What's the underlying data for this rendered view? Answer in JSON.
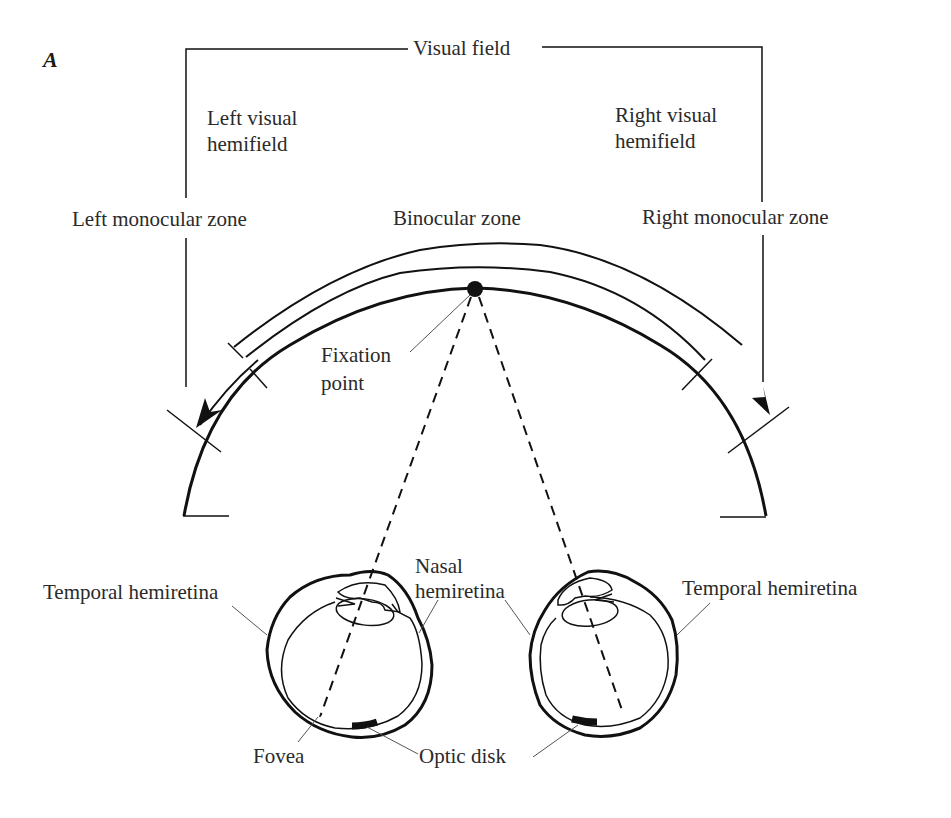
{
  "figure": {
    "panel_label": "A",
    "title": "Visual field",
    "labels": {
      "left_visual_hemifield_line1": "Left visual",
      "left_visual_hemifield_line2": "hemifield",
      "right_visual_hemifield_line1": "Right visual",
      "right_visual_hemifield_line2": "hemifield",
      "left_monocular_zone": "Left monocular zone",
      "binocular_zone": "Binocular zone",
      "right_monocular_zone": "Right monocular zone",
      "fixation_point_line1": "Fixation",
      "fixation_point_line2": "point",
      "temporal_hemiretina_left": "Temporal hemiretina",
      "nasal_hemiretina_line1": "Nasal",
      "nasal_hemiretina_line2": "hemiretina",
      "temporal_hemiretina_right": "Temporal hemiretina",
      "fovea": "Fovea",
      "optic_disk": "Optic disk"
    },
    "colors": {
      "ink": "#111111",
      "text": "#2a2a2a",
      "leader": "#555555",
      "background": "#ffffff"
    }
  }
}
